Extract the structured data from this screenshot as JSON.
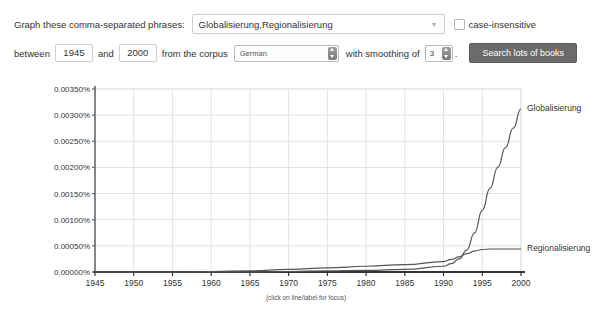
{
  "form": {
    "phrases_label": "Graph these comma-separated phrases:",
    "phrases_value": "Globalisierung,Regionalisierung",
    "phrases_caret_icon": "chevron-down-icon",
    "case_insensitive_label": "case-insensitive",
    "case_insensitive_checked": false,
    "between_label": "between",
    "start_year": "1945",
    "and_label": "and",
    "end_year": "2000",
    "corpus_label": "from the corpus",
    "corpus_value": "German",
    "smoothing_label": "with smoothing of",
    "smoothing_value": "3",
    "period": ".",
    "search_button": "Search lots of books"
  },
  "chart_data": {
    "type": "line",
    "title": "",
    "xlabel": "",
    "ylabel": "",
    "caption": "(click on line/label for focus)",
    "grid": true,
    "legend_position": "right-inline",
    "xlim": [
      1945,
      2000
    ],
    "ylim": [
      0.0,
      0.0035
    ],
    "xticks": [
      "1945",
      "1950",
      "1955",
      "1960",
      "1965",
      "1970",
      "1975",
      "1980",
      "1985",
      "1990",
      "1995",
      "2000"
    ],
    "yticks": [
      "0.00000%",
      "0.00050%",
      "0.00100%",
      "0.00150%",
      "0.00200%",
      "0.00250%",
      "0.00300%",
      "0.00350%"
    ],
    "ytick_values": [
      0.0,
      0.0005,
      0.001,
      0.0015,
      0.002,
      0.0025,
      0.003,
      0.0035
    ],
    "line_color": "#555555",
    "grid_color": "#e2e2e2",
    "axis_color": "#666666",
    "x": [
      1945,
      1950,
      1955,
      1960,
      1965,
      1970,
      1975,
      1980,
      1985,
      1990,
      1991,
      1992,
      1993,
      1994,
      1995,
      1996,
      1997,
      1998,
      1999,
      2000
    ],
    "series": [
      {
        "name": "Globalisierung",
        "values": [
          0.0,
          0.0,
          0.0,
          0.0,
          0.0,
          1e-05,
          2e-05,
          3e-05,
          5e-05,
          0.00011,
          0.00016,
          0.00025,
          0.00042,
          0.00075,
          0.00118,
          0.0016,
          0.002,
          0.00238,
          0.00275,
          0.00312
        ]
      },
      {
        "name": "Regionalisierung",
        "values": [
          0.0,
          0.0,
          0.0,
          1e-05,
          2e-05,
          5e-05,
          8e-05,
          0.00011,
          0.00014,
          0.0002,
          0.00024,
          0.00029,
          0.00035,
          0.0004,
          0.00043,
          0.00044,
          0.00044,
          0.00044,
          0.00044,
          0.00044
        ]
      }
    ]
  }
}
